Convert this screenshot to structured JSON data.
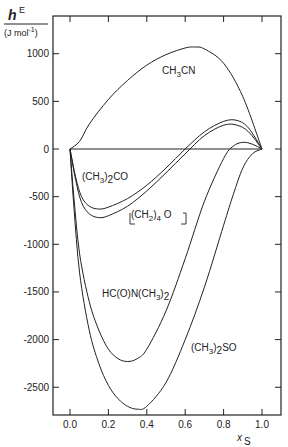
{
  "chart_data": {
    "type": "line",
    "title": "",
    "ylabel": "hE",
    "ylabel_sup": "E",
    "ylabel_main": "h",
    "yunit": "(J mol⁻¹)",
    "xlabel": "xS",
    "xlabel_main": "x",
    "xlabel_sub": "S",
    "xlim": [
      -0.1,
      1.1
    ],
    "ylim": [
      -2800,
      1150
    ],
    "xticks": [
      0.0,
      0.2,
      0.4,
      0.6,
      0.8,
      1.0
    ],
    "xtick_labels": [
      "0.0",
      "0.2",
      "0.4",
      "0.6",
      "0.8",
      "1.0"
    ],
    "yticks": [
      1000,
      500,
      0,
      -500,
      -1000,
      -1500,
      -2000,
      -2500
    ],
    "ytick_labels": [
      "1000",
      "500",
      "0",
      "-500",
      "-1000",
      "-1500",
      "-2000",
      "-2500"
    ],
    "grid": false,
    "series": [
      {
        "name": "CH3CN",
        "x": [
          0.0,
          0.05,
          0.1,
          0.2,
          0.3,
          0.4,
          0.5,
          0.6,
          0.65,
          0.7,
          0.8,
          0.9,
          1.0
        ],
        "y": [
          0,
          80,
          260,
          520,
          720,
          880,
          990,
          1060,
          1070,
          1050,
          900,
          550,
          0
        ]
      },
      {
        "name": "(CH3)2CO",
        "x": [
          0.0,
          0.03,
          0.06,
          0.1,
          0.15,
          0.2,
          0.3,
          0.4,
          0.5,
          0.6,
          0.7,
          0.8,
          0.87,
          0.93,
          1.0
        ],
        "y": [
          0,
          -300,
          -500,
          -600,
          -630,
          -610,
          -520,
          -380,
          -200,
          0,
          180,
          290,
          300,
          220,
          0
        ]
      },
      {
        "name": "(CH2)4O",
        "x": [
          0.0,
          0.03,
          0.06,
          0.1,
          0.15,
          0.2,
          0.3,
          0.4,
          0.5,
          0.6,
          0.7,
          0.8,
          0.87,
          0.93,
          1.0
        ],
        "y": [
          0,
          -330,
          -560,
          -680,
          -720,
          -700,
          -600,
          -440,
          -250,
          -50,
          140,
          250,
          250,
          180,
          0
        ]
      },
      {
        "name": "HC(O)N(CH3)2",
        "x": [
          0.0,
          0.02,
          0.05,
          0.1,
          0.15,
          0.2,
          0.25,
          0.3,
          0.35,
          0.4,
          0.5,
          0.6,
          0.7,
          0.8,
          0.85,
          0.9,
          0.95,
          1.0
        ],
        "y": [
          0,
          -500,
          -1100,
          -1600,
          -1900,
          -2100,
          -2200,
          -2230,
          -2200,
          -2100,
          -1700,
          -1150,
          -550,
          -100,
          30,
          70,
          50,
          0
        ]
      },
      {
        "name": "(CH3)2SO",
        "x": [
          0.0,
          0.02,
          0.05,
          0.1,
          0.15,
          0.2,
          0.25,
          0.3,
          0.35,
          0.4,
          0.5,
          0.6,
          0.7,
          0.8,
          0.85,
          0.9,
          0.95,
          1.0
        ],
        "y": [
          0,
          -600,
          -1300,
          -1900,
          -2250,
          -2480,
          -2620,
          -2700,
          -2730,
          -2700,
          -2450,
          -2000,
          -1450,
          -800,
          -480,
          -200,
          -50,
          0
        ]
      }
    ],
    "annotations": [
      "CH3CN",
      "(CH3)2CO",
      "(CH2)4O",
      "HC(O)N(CH3)2",
      "(CH3)2SO"
    ],
    "legend": "none (inline labels)"
  },
  "labels": {
    "ylabel_h": "h",
    "ylabel_E": "E",
    "yunit": "(J mol",
    "yunit_exp": "-1",
    "yunit_close": ")",
    "xlabel_x": "x",
    "xlabel_S": "S",
    "ch3cn_a": "CH",
    "ch3cn_b": "3",
    "ch3cn_c": "CN",
    "acetone_a": "(CH",
    "acetone_b": "3",
    "acetone_c": ")",
    "acetone_d": "2",
    "acetone_e": "CO",
    "thf_a": "(CH",
    "thf_b": "2",
    "thf_c": ")",
    "thf_d": "4",
    "thf_e": " O",
    "dmf_a": "HC(O)N(CH",
    "dmf_b": "3",
    "dmf_c": ")",
    "dmf_d": "2",
    "dmso_a": "(CH",
    "dmso_b": "3",
    "dmso_c": ")",
    "dmso_d": "2",
    "dmso_e": "SO"
  }
}
